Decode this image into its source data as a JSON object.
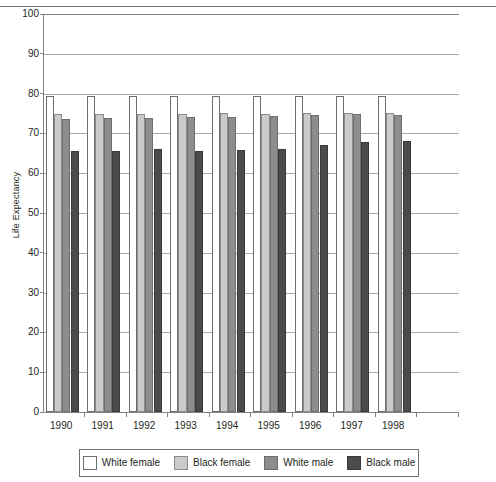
{
  "figure": {
    "title_cropped": "",
    "ylabel": "Life Expectancy"
  },
  "chart_data": {
    "type": "bar",
    "title": "",
    "xlabel": "",
    "ylabel": "Life Expectancy",
    "ylim": [
      0,
      100
    ],
    "ytick_step": 10,
    "grid": true,
    "legend_position": "bottom",
    "categories": [
      "1990",
      "1991",
      "1992",
      "1993",
      "1994",
      "1995",
      "1996",
      "1997",
      "1998"
    ],
    "series": [
      {
        "name": "White female",
        "color": "#ffffff",
        "values": [
          79.5,
          79.5,
          79.5,
          79.5,
          79.5,
          79.5,
          79.5,
          79.5,
          79.5
        ]
      },
      {
        "name": "Black female",
        "color": "#c9cacb",
        "values": [
          74.9,
          74.9,
          75.0,
          75.0,
          75.1,
          75.0,
          75.1,
          75.2,
          75.2
        ]
      },
      {
        "name": "White male",
        "color": "#8b8d8f",
        "values": [
          73.6,
          73.8,
          73.9,
          74.0,
          74.2,
          74.4,
          74.6,
          74.8,
          74.6
        ]
      },
      {
        "name": "Black male",
        "color": "#4b4b4d",
        "values": [
          65.6,
          65.6,
          66.0,
          65.7,
          65.9,
          66.2,
          67.0,
          67.8,
          68.1
        ]
      }
    ]
  },
  "yticks": [
    "0",
    "10",
    "20",
    "30",
    "40",
    "50",
    "60",
    "70",
    "80",
    "90",
    "100"
  ],
  "legend": {
    "items": [
      {
        "label": "White female",
        "swatch": "white-female-swatch"
      },
      {
        "label": "Black female",
        "swatch": "black-female-swatch"
      },
      {
        "label": "White male",
        "swatch": "white-male-swatch"
      },
      {
        "label": "Black male",
        "swatch": "black-male-swatch"
      }
    ]
  }
}
